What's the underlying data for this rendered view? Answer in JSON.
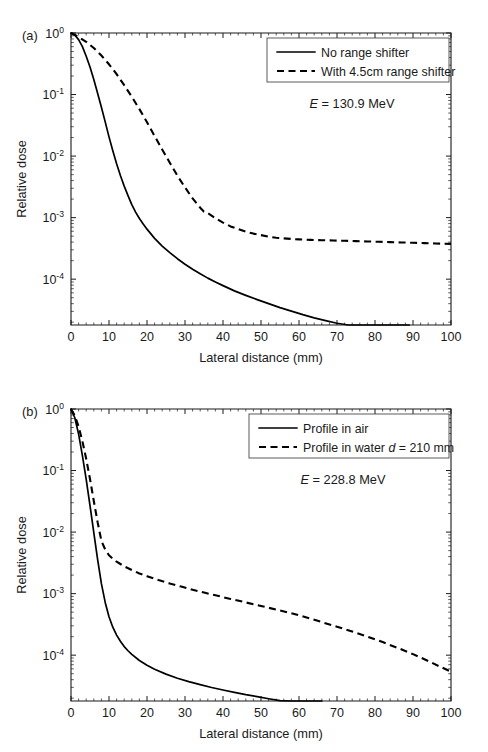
{
  "figure": {
    "background": "#ffffff",
    "line_color": "#000000",
    "axis_color": "#1a1a1a"
  },
  "chart_data": [
    {
      "type": "line",
      "panel_label": "(a)",
      "title": "",
      "xlabel": "Lateral distance (mm)",
      "ylabel": "Relative dose",
      "yscale": "log",
      "xlim": [
        0,
        100
      ],
      "ylim": [
        1.8e-05,
        1.0
      ],
      "xticks": [
        0,
        10,
        20,
        30,
        40,
        50,
        60,
        70,
        80,
        90,
        100
      ],
      "xticklabels": [
        "0",
        "10",
        "20",
        "30",
        "40",
        "50",
        "60",
        "70",
        "80",
        "90",
        "100"
      ],
      "yticks": [
        1,
        0.1,
        0.01,
        0.001,
        0.0001
      ],
      "yticklabels": [
        "10^0",
        "10^-1",
        "10^-2",
        "10^-3",
        "10^-4"
      ],
      "grid": false,
      "legend_position": "upper right",
      "annotation": "E = 130.9 MeV",
      "annotation_italic_symbol": "E",
      "annotation_rest": " = 130.9 MeV",
      "series": [
        {
          "name": "No range shifter",
          "style": "solid",
          "x": [
            0,
            1,
            2,
            3,
            4,
            5,
            6,
            7,
            8,
            9,
            10,
            11,
            12,
            13,
            14,
            15,
            16,
            17,
            18,
            19,
            20,
            22,
            24,
            26,
            28,
            30,
            32,
            34,
            36,
            38,
            40,
            43,
            46,
            49,
            52,
            55,
            58,
            61,
            64,
            67,
            70,
            73,
            76,
            79,
            82,
            85,
            88,
            89
          ],
          "y": [
            1.0,
            0.93,
            0.78,
            0.6,
            0.42,
            0.28,
            0.175,
            0.105,
            0.062,
            0.036,
            0.0205,
            0.0122,
            0.0075,
            0.00485,
            0.00325,
            0.00228,
            0.00163,
            0.00123,
            0.00097,
            0.00079,
            0.00065,
            0.00046,
            0.000345,
            0.00027,
            0.000215,
            0.000175,
            0.000145,
            0.000122,
            0.000104,
            9e-05,
            7.85e-05,
            6.45e-05,
            5.45e-05,
            4.65e-05,
            4e-05,
            3.45e-05,
            3.02e-05,
            2.65e-05,
            2.35e-05,
            2.12e-05,
            1.92e-05,
            1.75e-05,
            1.6e-05,
            1.47e-05,
            1.34e-05,
            1.22e-05,
            1.08e-05,
            9.8e-06
          ]
        },
        {
          "name": "With 4.5cm range shifter",
          "style": "dashed",
          "x": [
            0,
            2,
            4,
            6,
            8,
            10,
            12,
            14,
            16,
            18,
            20,
            22,
            24,
            26,
            28,
            30,
            32,
            34,
            35,
            36,
            38,
            40,
            42,
            44,
            46,
            48,
            50,
            52,
            54,
            56,
            58,
            60,
            63,
            66,
            69,
            72,
            75,
            78,
            81,
            84,
            87,
            90,
            93,
            96,
            100
          ],
          "y": [
            1.0,
            0.86,
            0.72,
            0.57,
            0.43,
            0.31,
            0.215,
            0.142,
            0.092,
            0.058,
            0.0355,
            0.0212,
            0.0128,
            0.0078,
            0.0048,
            0.0031,
            0.00205,
            0.00145,
            0.00125,
            0.00118,
            0.00098,
            0.00083,
            0.00072,
            0.00065,
            0.00059,
            0.00055,
            0.00052,
            0.00049,
            0.00047,
            0.00046,
            0.00045,
            0.000443,
            0.000435,
            0.00043,
            0.000425,
            0.00042,
            0.000415,
            0.00041,
            0.000405,
            0.0004,
            0.000395,
            0.00039,
            0.000385,
            0.00038,
            0.000375
          ]
        }
      ]
    },
    {
      "type": "line",
      "panel_label": "(b)",
      "title": "",
      "xlabel": "Lateral distance (mm)",
      "ylabel": "Relative dose",
      "yscale": "log",
      "xlim": [
        0,
        100
      ],
      "ylim": [
        1.8e-05,
        1.0
      ],
      "xticks": [
        0,
        10,
        20,
        30,
        40,
        50,
        60,
        70,
        80,
        90,
        100
      ],
      "xticklabels": [
        "0",
        "10",
        "20",
        "30",
        "40",
        "50",
        "60",
        "70",
        "80",
        "90",
        "100"
      ],
      "yticks": [
        1,
        0.1,
        0.01,
        0.001,
        0.0001
      ],
      "yticklabels": [
        "10^0",
        "10^-1",
        "10^-2",
        "10^-3",
        "10^-4"
      ],
      "grid": false,
      "legend_position": "upper right",
      "annotation": "E = 228.8 MeV",
      "annotation_italic_symbol": "E",
      "annotation_rest": " = 228.8 MeV",
      "series": [
        {
          "name": "Profile in air",
          "style": "solid",
          "x": [
            0,
            1,
            2,
            3,
            4,
            5,
            6,
            7,
            8,
            9,
            10,
            11,
            12,
            13,
            14,
            15,
            16,
            18,
            20,
            22,
            25,
            28,
            31,
            34,
            37,
            40,
            43,
            46,
            49,
            52,
            55,
            58,
            61,
            64,
            66
          ],
          "y": [
            1.0,
            0.72,
            0.39,
            0.175,
            0.072,
            0.027,
            0.0098,
            0.0036,
            0.00145,
            0.00072,
            0.00042,
            0.000285,
            0.000212,
            0.000168,
            0.000138,
            0.000118,
            0.000103,
            8.2e-05,
            6.85e-05,
            5.92e-05,
            4.92e-05,
            4.22e-05,
            3.72e-05,
            3.32e-05,
            2.98e-05,
            2.72e-05,
            2.48e-05,
            2.28e-05,
            2.12e-05,
            1.96e-05,
            1.82e-05,
            1.68e-05,
            1.55e-05,
            1.42e-05,
            1.32e-05
          ]
        },
        {
          "name": "Profile in water d = 210 mm",
          "style": "dashed",
          "legend_italic_symbol": "d",
          "legend_prefix": "Profile in water ",
          "legend_suffix": " = 210 mm",
          "x": [
            0,
            1,
            2,
            3,
            4,
            5,
            6,
            7,
            8,
            9,
            10,
            11,
            12,
            14,
            16,
            18,
            20,
            23,
            26,
            29,
            32,
            35,
            38,
            42,
            46,
            50,
            54,
            58,
            62,
            66,
            70,
            74,
            78,
            82,
            86,
            90,
            94,
            97,
            100
          ],
          "y": [
            1.0,
            0.78,
            0.52,
            0.3,
            0.155,
            0.073,
            0.032,
            0.0145,
            0.0072,
            0.0052,
            0.0042,
            0.0037,
            0.0033,
            0.00278,
            0.00242,
            0.00213,
            0.00192,
            0.00166,
            0.00146,
            0.0013,
            0.00116,
            0.00104,
            0.00094,
            0.00082,
            0.00072,
            0.00063,
            0.00055,
            0.00048,
            0.00041,
            0.000345,
            0.00029,
            0.000242,
            0.0002,
            0.000163,
            0.000131,
            0.000104,
            8.05e-05,
            6.55e-05,
            5.4e-05
          ]
        }
      ]
    }
  ]
}
